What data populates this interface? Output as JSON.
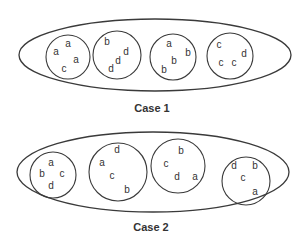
{
  "diagram": {
    "stroke_color": "#3a3a3a",
    "text_color": "#333333",
    "cases": [
      {
        "caption": "Case 1",
        "groups": [
          {
            "name": "group-1",
            "letters": [
              "a",
              "a",
              "a",
              "c"
            ]
          },
          {
            "name": "group-2",
            "letters": [
              "b",
              "d",
              "d",
              "d"
            ]
          },
          {
            "name": "group-3",
            "letters": [
              "a",
              "b",
              "b",
              "b"
            ]
          },
          {
            "name": "group-4",
            "letters": [
              "c",
              "d",
              "c",
              "c"
            ]
          }
        ]
      },
      {
        "caption": "Case 2",
        "groups": [
          {
            "name": "group-1",
            "letters": [
              "a",
              "b",
              "c",
              "d"
            ]
          },
          {
            "name": "group-2",
            "letters": [
              "d",
              "a",
              "c",
              "b"
            ]
          },
          {
            "name": "group-3",
            "letters": [
              "b",
              "c",
              "d",
              "a"
            ]
          },
          {
            "name": "group-4",
            "letters": [
              "d",
              "b",
              "c",
              "a"
            ]
          }
        ]
      }
    ]
  }
}
